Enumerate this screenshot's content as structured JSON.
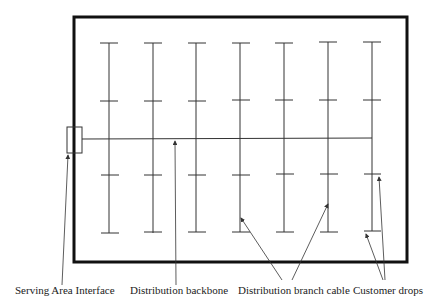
{
  "diagram": {
    "labels": {
      "sai": "Serving Area Interface",
      "backbone": "Distribution backbone",
      "branch": "Distribution branch cable",
      "drops": "Customer drops"
    },
    "branch_count": 7,
    "colors": {
      "line": "#333333",
      "border": "#111111",
      "background": "#ffffff"
    }
  }
}
